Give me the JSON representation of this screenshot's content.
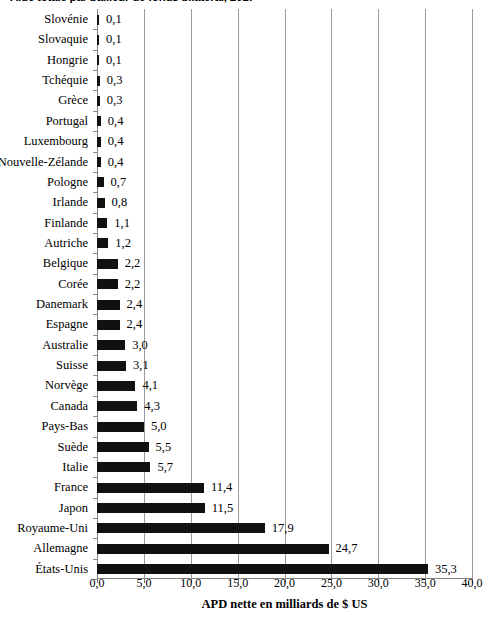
{
  "chart_data": {
    "type": "bar",
    "orientation": "horizontal",
    "title": "Aide totale par bailleur de fonds bilatéral, 2017",
    "xlabel": "APD nette en milliards de $ US",
    "ylabel": "",
    "xlim": [
      0.0,
      40.0
    ],
    "xticks": [
      0.0,
      5.0,
      10.0,
      15.0,
      20.0,
      25.0,
      30.0,
      35.0,
      40.0
    ],
    "xtick_labels": [
      "0,0",
      "5,0",
      "10,0",
      "15,0",
      "20,0",
      "25,0",
      "30,0",
      "35,0",
      "40,0"
    ],
    "grid": true,
    "legend": null,
    "bar_color": "#111111",
    "decimal_separator": ",",
    "categories": [
      "Slovénie",
      "Slovaquie",
      "Hongrie",
      "Tchéquie",
      "Grèce",
      "Portugal",
      "Luxembourg",
      "Nouvelle-Zélande",
      "Pologne",
      "Irlande",
      "Finlande",
      "Autriche",
      "Belgique",
      "Corée",
      "Danemark",
      "Espagne",
      "Australie",
      "Suisse",
      "Norvège",
      "Canada",
      "Pays-Bas",
      "Suède",
      "Italie",
      "France",
      "Japon",
      "Royaume-Uni",
      "Allemagne",
      "États-Unis"
    ],
    "values": [
      0.1,
      0.1,
      0.1,
      0.3,
      0.3,
      0.4,
      0.4,
      0.4,
      0.7,
      0.8,
      1.1,
      1.2,
      2.2,
      2.2,
      2.4,
      2.4,
      3.0,
      3.1,
      4.1,
      4.3,
      5.0,
      5.5,
      5.7,
      11.4,
      11.5,
      17.9,
      24.7,
      35.3
    ],
    "value_labels": [
      "0,1",
      "0,1",
      "0,1",
      "0,3",
      "0,3",
      "0,4",
      "0,4",
      "0,4",
      "0,7",
      "0,8",
      "1,1",
      "1,2",
      "2,2",
      "2,2",
      "2,4",
      "2,4",
      "3,0",
      "3,1",
      "4,1",
      "4,3",
      "5,0",
      "5,5",
      "5,7",
      "11,4",
      "11,5",
      "17,9",
      "24,7",
      "35,3"
    ]
  }
}
